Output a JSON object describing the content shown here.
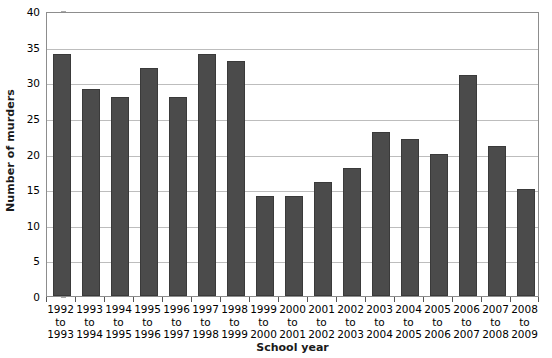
{
  "chart_data": {
    "type": "bar",
    "title": "",
    "xlabel": "School year",
    "ylabel": "Number of murders",
    "categories": [
      "1992 to 1993",
      "1993 to 1994",
      "1994 to 1995",
      "1995 to 1996",
      "1996 to 1997",
      "1997 to 1998",
      "1998 to 1999",
      "1999 to 2000",
      "2000 to 2001",
      "2001 to 2002",
      "2002 to 2003",
      "2003 to 2004",
      "2004 to 2005",
      "2005 to 2006",
      "2006 to 2007",
      "2007 to 2008",
      "2008 to 2009"
    ],
    "category_lines": [
      [
        "1992",
        "to",
        "1993"
      ],
      [
        "1993",
        "to",
        "1994"
      ],
      [
        "1994",
        "to",
        "1995"
      ],
      [
        "1995",
        "to",
        "1996"
      ],
      [
        "1996",
        "to",
        "1997"
      ],
      [
        "1997",
        "to",
        "1998"
      ],
      [
        "1998",
        "to",
        "1999"
      ],
      [
        "1999",
        "to",
        "2000"
      ],
      [
        "2000",
        "to",
        "2001"
      ],
      [
        "2001",
        "to",
        "2002"
      ],
      [
        "2002",
        "to",
        "2003"
      ],
      [
        "2003",
        "to",
        "2004"
      ],
      [
        "2004",
        "to",
        "2005"
      ],
      [
        "2005",
        "to",
        "2006"
      ],
      [
        "2006",
        "to",
        "2007"
      ],
      [
        "2007",
        "to",
        "2008"
      ],
      [
        "2008",
        "to",
        "2009"
      ]
    ],
    "values": [
      34,
      29,
      28,
      32,
      28,
      34,
      33,
      14,
      14,
      16,
      18,
      23,
      22,
      20,
      31,
      21,
      15
    ],
    "ylim": [
      0,
      40
    ],
    "ytick_values": [
      0,
      5,
      10,
      15,
      20,
      25,
      30,
      35,
      40
    ],
    "ytick_labels": [
      "0",
      "5",
      "10",
      "15",
      "20",
      "25",
      "30",
      "35",
      "40"
    ],
    "grid": true,
    "grid_axis": "y",
    "legend": "none",
    "bar_color": "#4b4b4b",
    "bar_edge_color": "#3a3a3a",
    "grid_color": "#bdbdbd",
    "axis_color": "#8d8d8d",
    "background_color": "#ffffff"
  }
}
